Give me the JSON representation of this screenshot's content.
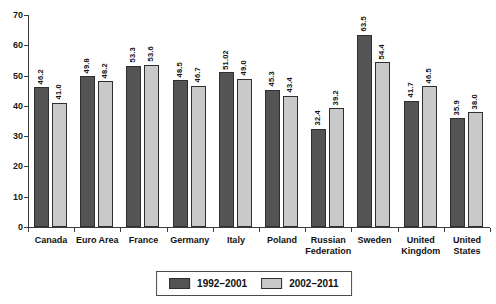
{
  "chart_data": {
    "type": "bar",
    "title": "",
    "categories": [
      "Canada",
      "Euro Area",
      "France",
      "Germany",
      "Italy",
      "Poland",
      "Russian Federation",
      "Sweden",
      "United Kingdom",
      "United States"
    ],
    "series": [
      {
        "name": "1992–2001",
        "color": "#545454",
        "values": [
          46.2,
          49.8,
          53.3,
          48.5,
          51.02,
          45.3,
          32.4,
          63.5,
          41.7,
          35.9
        ],
        "labels": [
          "46.2",
          "49.8",
          "53.3",
          "48.5",
          "51.02",
          "45.3",
          "32.4",
          "63.5",
          "41.7",
          "35.9"
        ]
      },
      {
        "name": "2002–2011",
        "color": "#c9c9c9",
        "values": [
          41.0,
          48.2,
          53.6,
          46.7,
          49.0,
          43.4,
          39.2,
          54.4,
          46.5,
          38.0
        ],
        "labels": [
          "41.0",
          "48.2",
          "53.6",
          "46.7",
          "49.0",
          "43.4",
          "39.2",
          "54.4",
          "46.5",
          "38.0"
        ]
      }
    ],
    "ylabel": "",
    "xlabel": "",
    "ylim": [
      0,
      70
    ],
    "yticks": [
      0,
      10,
      20,
      30,
      40,
      50,
      60,
      70
    ],
    "grid": false,
    "legend_position": "bottom-center"
  }
}
